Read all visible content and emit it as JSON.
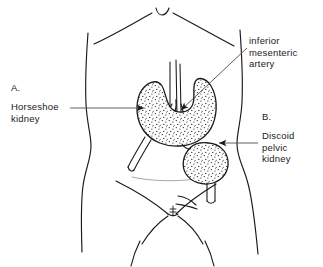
{
  "figure": {
    "background_color": "#ffffff",
    "ink_color": "#1a1a1a",
    "stipple_color": "#111111"
  },
  "labels": {
    "inferior_mesenteric_artery": "inferior\nmesenteric\nartery",
    "panel_a_letter": "A.",
    "horseshoe_kidney": "Horseshoe\nkidney",
    "panel_b_letter": "B.",
    "discoid_pelvic_kidney": "Discoid\npelvic\nkidney"
  },
  "anatomy": {
    "torso_outline": "anterior-abdominal-wall-outline",
    "costal_margin": "rib-cage-costal-margin-arch",
    "xiphoid_notch": "xiphoid-process-notch",
    "pelvic_brim": "pelvic-brim-inguinal-lines",
    "pubic_symphysis": "pubic-symphysis",
    "horseshoe_kidney_shape": "u-shaped-fused-kidney-stippled",
    "discoid_kidney_shape": "oval-discoid-kidney-stippled",
    "aorta": "abdominal-aorta-vessel",
    "inferior_mesenteric_artery_vessel": "inferior-mesenteric-artery-branch",
    "left_ureter": "left-ureter-tube",
    "right_ureter": "right-ureter-tube"
  },
  "leaders": {
    "ima_leader": "diagonal-leader-line-to-artery",
    "horseshoe_leader": "horizontal-arrow-to-horseshoe-kidney",
    "discoid_leader": "horizontal-arrow-to-discoid-kidney"
  }
}
